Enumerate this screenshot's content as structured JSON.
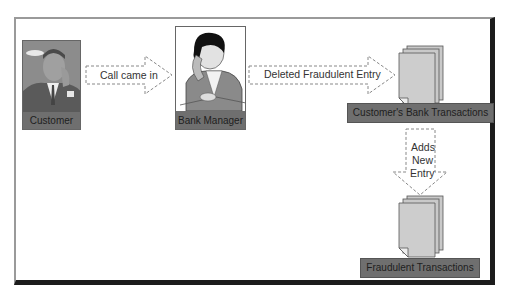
{
  "diagram": {
    "nodes": [
      {
        "id": "customer",
        "label": "Customer",
        "icon": "person-on-phone-illustration"
      },
      {
        "id": "bank_manager",
        "label": "Bank Manager",
        "icon": "person-on-phone-illustration"
      },
      {
        "id": "customer_transactions",
        "label": "Customer's Bank Transactions",
        "icon": "document-stack-icon"
      },
      {
        "id": "fraudulent_transactions",
        "label": "Fraudulent Transactions",
        "icon": "document-stack-icon"
      }
    ],
    "edges": [
      {
        "from": "customer",
        "to": "bank_manager",
        "label": "Call came in"
      },
      {
        "from": "bank_manager",
        "to": "customer_transactions",
        "label": "Deleted Fraudulent Entry"
      },
      {
        "from": "customer_transactions",
        "to": "fraudulent_transactions",
        "label_lines": [
          "Adds",
          "New",
          "Entry"
        ]
      }
    ]
  },
  "colors": {
    "label_bar": "#6f6f6f",
    "document_fill": "#c9c9c9",
    "frame_shadow": "#1c1c1c",
    "frame_light": "#9a9a9a"
  }
}
